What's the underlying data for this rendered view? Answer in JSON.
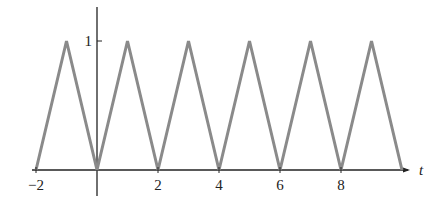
{
  "chart_data": {
    "type": "line",
    "title": "",
    "xlabel": "t",
    "ylabel": "",
    "x": [
      -2,
      -1,
      0,
      1,
      2,
      3,
      4,
      5,
      6,
      7,
      8,
      9,
      10
    ],
    "series": [
      {
        "name": "triangle wave",
        "values": [
          0,
          1,
          0,
          1,
          0,
          1,
          0,
          1,
          0,
          1,
          0,
          1,
          0
        ],
        "color": "#8a8a8a"
      }
    ],
    "x_ticks": [
      -2,
      2,
      4,
      6,
      8
    ],
    "x_tick_labels": [
      "−2",
      "2",
      "4",
      "6",
      "8"
    ],
    "y_ticks": [
      1
    ],
    "y_tick_labels": [
      "1"
    ],
    "xlim": [
      -2,
      10
    ],
    "ylim": [
      0,
      1
    ],
    "grid": false,
    "legend": null
  },
  "axis_color": "#222222"
}
